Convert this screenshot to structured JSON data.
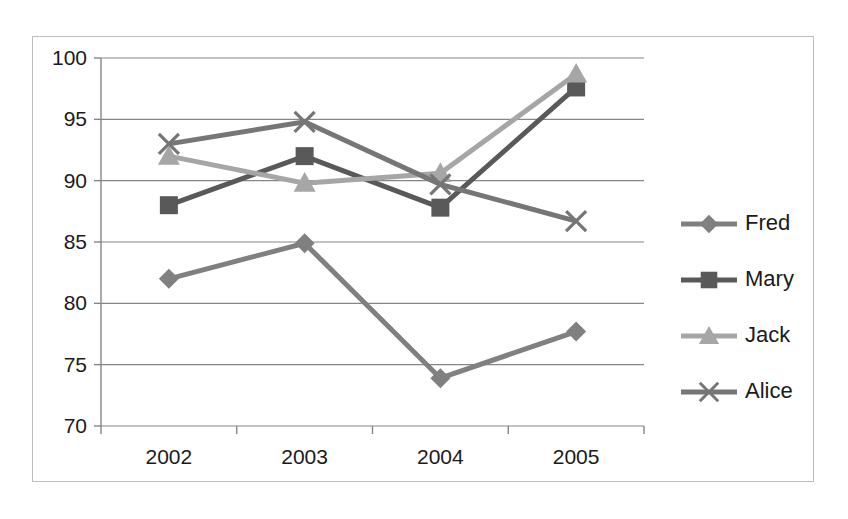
{
  "chart_data": {
    "type": "line",
    "title": "",
    "xlabel": "",
    "ylabel": "",
    "categories": [
      "2002",
      "2003",
      "2004",
      "2005"
    ],
    "ylim": [
      70,
      100
    ],
    "yticks": [
      70,
      75,
      80,
      85,
      90,
      95,
      100
    ],
    "ytick_labels": [
      "70",
      "75",
      "80",
      "85",
      "90",
      "95",
      "100"
    ],
    "grid": true,
    "legend_position": "right",
    "series": [
      {
        "name": "Fred",
        "values": [
          82.0,
          84.9,
          73.9,
          77.7
        ],
        "color": "#808080",
        "marker": "diamond"
      },
      {
        "name": "Mary",
        "values": [
          88.0,
          92.0,
          87.8,
          97.6
        ],
        "color": "#595959",
        "marker": "square"
      },
      {
        "name": "Jack",
        "values": [
          92.0,
          89.8,
          90.6,
          98.7
        ],
        "color": "#a6a6a6",
        "marker": "triangle"
      },
      {
        "name": "Alice",
        "values": [
          93.0,
          94.8,
          89.7,
          86.7
        ],
        "color": "#767676",
        "marker": "x"
      }
    ]
  },
  "legend": {
    "items": [
      {
        "label": "Fred"
      },
      {
        "label": "Mary"
      },
      {
        "label": "Jack"
      },
      {
        "label": "Alice"
      }
    ]
  }
}
